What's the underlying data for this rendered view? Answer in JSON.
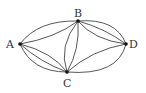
{
  "diagram": {
    "type": "multigraph",
    "nodes": [
      {
        "id": "A",
        "label": "A",
        "x": 20,
        "y": 44
      },
      {
        "id": "B",
        "label": "B",
        "x": 78,
        "y": 21
      },
      {
        "id": "C",
        "label": "C",
        "x": 67,
        "y": 72
      },
      {
        "id": "D",
        "label": "D",
        "x": 126,
        "y": 44
      }
    ],
    "edges": [
      {
        "from": "A",
        "to": "B",
        "count": 2
      },
      {
        "from": "A",
        "to": "C",
        "count": 3
      },
      {
        "from": "B",
        "to": "C",
        "count": 2
      },
      {
        "from": "B",
        "to": "D",
        "count": 3
      },
      {
        "from": "C",
        "to": "D",
        "count": 2
      }
    ],
    "colors": {
      "edge": "#444444",
      "node": "#111111",
      "label": "#333333"
    }
  }
}
